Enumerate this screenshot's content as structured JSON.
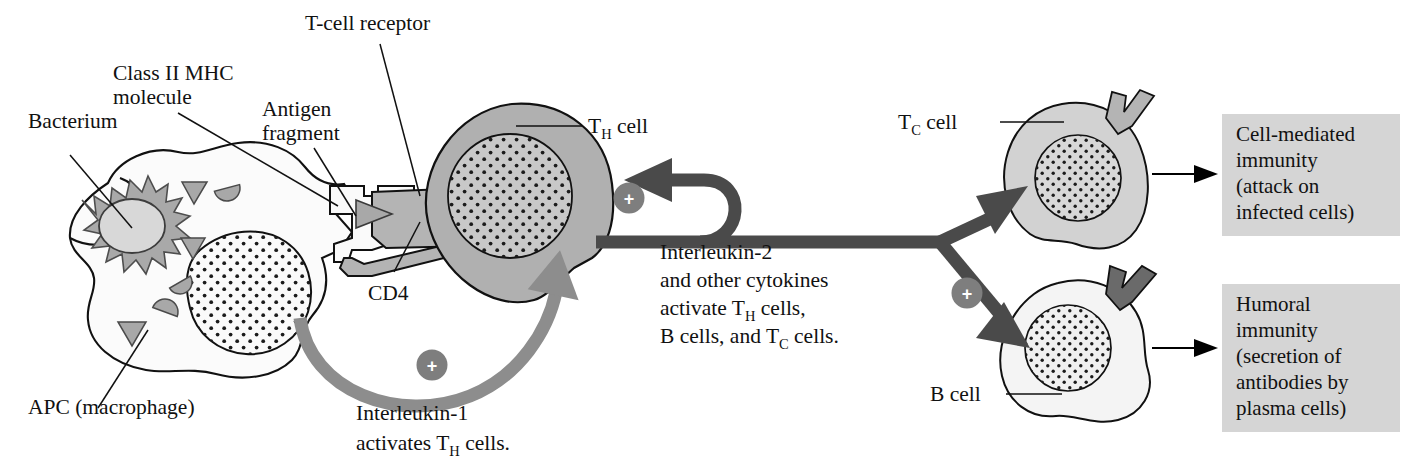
{
  "figure": {
    "type": "biology-diagram",
    "title_visible": false,
    "background": "#ffffff"
  },
  "colors": {
    "th_cell_fill": "#b0b0b0",
    "th_nucleus_fill": "#c8c8c8",
    "tc_cell_fill": "#d2d2d2",
    "tc_nucleus_fill": "#d8d8d8",
    "b_cell_fill": "#f4f4f4",
    "b_nucleus_fill": "#f0f0f0",
    "macrophage_fill": "#fbfbfb",
    "macrophage_nucleus_fill": "#fafafa",
    "bacterium_fill": "#a9a9a9",
    "bacterium_body_fill": "#d6d6d6",
    "fragment_fill": "#a8a8a8",
    "receptor_fill": "#b4b4b4",
    "mhc_fill": "#fafafa",
    "il2_arrow": "#4a4a4a",
    "il1_arrow": "#8d8d8d",
    "tc_receptor": "#b4b4b4",
    "b_receptor": "#6a6a6a",
    "plus_badge": "#7e7e7e",
    "outcome_box": "#d5d5d5",
    "stroke": "#111111"
  },
  "labels": {
    "bacterium": "Bacterium",
    "class_ii_mhc_line1": "Class II MHC",
    "class_ii_mhc_line2": "molecule",
    "antigen_line1": "Antigen",
    "antigen_line2": "fragment",
    "tcell_receptor": "T-cell receptor",
    "cd4": "CD4",
    "apc": "APC (macrophage)",
    "th_cell_t": "T",
    "th_cell_sub": "H",
    "th_cell_rest": " cell",
    "tc_cell_t": "T",
    "tc_cell_sub": "C",
    "tc_cell_rest": " cell",
    "b_cell": "B cell"
  },
  "interleukin1": {
    "line1": "Interleukin-1",
    "line2_pre": "activates T",
    "line2_sub": "H",
    "line2_post": " cells.",
    "badge": "+"
  },
  "interleukin2": {
    "line1": "Interleukin-2",
    "line2": "and other cytokines",
    "line3_pre": "activate T",
    "line3_sub": "H",
    "line3_post": " cells,",
    "line4_pre": "B cells, and T",
    "line4_sub": "C",
    "line4_post": " cells.",
    "badge_th": "+",
    "badge_right": "+"
  },
  "outcomes": [
    {
      "name": "cell-mediated-immunity",
      "lines": [
        "Cell-mediated",
        "immunity",
        "(attack on",
        "infected cells)"
      ]
    },
    {
      "name": "humoral-immunity",
      "lines": [
        "Humoral",
        "immunity",
        "(secretion of",
        "antibodies by",
        "plasma cells)"
      ]
    }
  ]
}
